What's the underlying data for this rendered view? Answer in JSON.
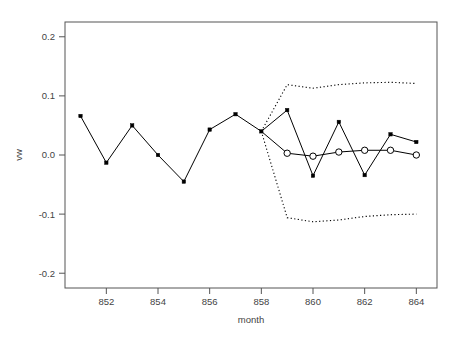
{
  "chart_data": {
    "type": "line",
    "title": "",
    "subtitle": "",
    "xlabel": "month",
    "ylabel": "vw",
    "xlim": [
      850.4,
      864.8
    ],
    "ylim": [
      -0.225,
      0.225
    ],
    "grid": false,
    "legend": false,
    "legend_position": "none",
    "xticks": [
      852,
      854,
      856,
      858,
      860,
      862,
      864
    ],
    "xticklabels": [
      "852",
      "854",
      "856",
      "858",
      "860",
      "862",
      "864"
    ],
    "yticks": [
      0.2,
      0.1,
      0.0,
      -0.1,
      -0.2
    ],
    "yticklabels": [
      "0.2",
      "0.1",
      "0.0",
      "-0.1",
      "-0.2"
    ],
    "series": [
      {
        "name": "observed",
        "marker": "filled-square",
        "linestyle": "solid",
        "color": "#000000",
        "x": [
          851,
          852,
          853,
          854,
          855,
          856,
          857,
          858,
          859,
          860,
          861,
          862,
          863,
          864
        ],
        "values": [
          0.066,
          -0.013,
          0.05,
          0.0,
          -0.045,
          0.043,
          0.069,
          0.04,
          0.076,
          -0.035,
          0.056,
          -0.034,
          0.035,
          0.022
        ]
      },
      {
        "name": "forecast",
        "marker": "open-circle",
        "linestyle": "solid",
        "color": "#000000",
        "x": [
          858,
          859,
          860,
          861,
          862,
          863,
          864
        ],
        "values": [
          0.04,
          0.003,
          -0.002,
          0.005,
          0.008,
          0.008,
          0.0
        ]
      },
      {
        "name": "upper-bound",
        "marker": "none",
        "linestyle": "dotted",
        "color": "#000000",
        "x": [
          858,
          859,
          860,
          861,
          862,
          863,
          864
        ],
        "values": [
          0.04,
          0.119,
          0.113,
          0.119,
          0.122,
          0.123,
          0.121
        ]
      },
      {
        "name": "lower-bound",
        "marker": "none",
        "linestyle": "dotted",
        "color": "#000000",
        "x": [
          858,
          859,
          860,
          861,
          862,
          863,
          864
        ],
        "values": [
          0.04,
          -0.106,
          -0.113,
          -0.11,
          -0.104,
          -0.101,
          -0.1
        ]
      }
    ]
  },
  "axes": {
    "x_title": "month",
    "y_title": "vw"
  },
  "colors": {
    "foreground": "#000000",
    "axis": "#555555",
    "text": "#444444",
    "background": "#ffffff"
  }
}
